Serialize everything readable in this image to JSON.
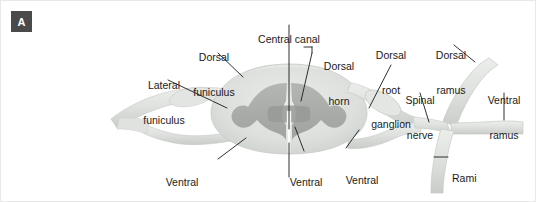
{
  "figure": {
    "panel_label": "A",
    "background_color": "#ffffff"
  },
  "colors": {
    "white_matter": "#d9dcd9",
    "white_matter_light": "#e4e7e4",
    "gray_matter": "#a9aca9",
    "gray_matter_dark": "#9b9e9b",
    "nerve": "#dfe2df",
    "nerve_edge": "#c2c5c2",
    "central_canal": "#fdfdfd",
    "leader_line": "#1a1a1a",
    "text": "#1a1a1a",
    "badge_bg": "#4a4a4a",
    "badge_text": "#ffffff"
  },
  "labels": [
    {
      "id": "central-canal",
      "text": "Central canal",
      "lines": [
        "Central canal"
      ],
      "x": 243,
      "y": 10,
      "w": 90,
      "align": "center"
    },
    {
      "id": "dorsal-funiculus",
      "text": "Dorsal funiculus",
      "lines": [
        "Dorsal",
        "funiculus"
      ],
      "x": 181,
      "y": 28,
      "w": 64,
      "align": "center"
    },
    {
      "id": "lateral-funiculus",
      "text": "Lateral funiculus",
      "lines": [
        "Lateral",
        "funiculus"
      ],
      "x": 131,
      "y": 56,
      "w": 64,
      "align": "center"
    },
    {
      "id": "dorsal-horn",
      "text": "Dorsal horn",
      "lines": [
        "Dorsal",
        "horn"
      ],
      "x": 322,
      "y": 37,
      "w": 44,
      "align": "center"
    },
    {
      "id": "dorsal-root-ganglion",
      "text": "Dorsal root ganglion",
      "lines": [
        "Dorsal",
        "root",
        "ganglion"
      ],
      "x": 362,
      "y": 26,
      "w": 58,
      "align": "center"
    },
    {
      "id": "dorsal-ramus",
      "text": "Dorsal ramus",
      "lines": [
        "Dorsal",
        "ramus"
      ],
      "x": 424,
      "y": 26,
      "w": 52,
      "align": "center"
    },
    {
      "id": "spinal-nerve",
      "text": "Spinal nerve",
      "lines": [
        "Spinal",
        "nerve"
      ],
      "x": 398,
      "y": 71,
      "w": 46,
      "align": "center"
    },
    {
      "id": "ventral-ramus",
      "text": "Ventral ramus",
      "lines": [
        "Ventral",
        "ramus"
      ],
      "x": 478,
      "y": 71,
      "w": 52,
      "align": "center"
    },
    {
      "id": "ventral-funiculus",
      "text": "Ventral funiculus",
      "lines": [
        "Ventral",
        "funiculus"
      ],
      "x": 149,
      "y": 153,
      "w": 64,
      "align": "center"
    },
    {
      "id": "ventral-horn",
      "text": "Ventral horn",
      "lines": [
        "Ventral",
        "horn"
      ],
      "x": 281,
      "y": 153,
      "w": 48,
      "align": "center"
    },
    {
      "id": "ventral-root",
      "text": "Ventral root",
      "lines": [
        "Ventral",
        "root"
      ],
      "x": 337,
      "y": 151,
      "w": 48,
      "align": "center"
    },
    {
      "id": "anterior-median-fissure",
      "text": "Anterior median fissure",
      "lines": [
        "Anterior median fissure"
      ],
      "x": 198,
      "y": 182,
      "w": 140,
      "align": "center"
    },
    {
      "id": "rami-communicantes",
      "text": "Rami communicantes",
      "lines": [
        "Rami",
        "communicantes"
      ],
      "x": 449,
      "y": 150,
      "w": 84,
      "align": "left"
    }
  ],
  "leaders": [
    {
      "id": "leader-central-canal",
      "from": [
        288,
        24
      ],
      "to": [
        288,
        128
      ]
    },
    {
      "id": "leader-dorsal-funiculus",
      "from": [
        217,
        52
      ],
      "to": [
        240,
        75
      ]
    },
    {
      "id": "leader-lateral-funiculus",
      "from": [
        166,
        79
      ],
      "to": [
        224,
        106
      ]
    },
    {
      "id": "leader-dorsal-horn",
      "from": [
        312,
        46
      ],
      "to": [
        303,
        46
      ]
    },
    {
      "id": "leader-dorsal-horn-2",
      "from": [
        312,
        46
      ],
      "to": [
        300,
        100
      ]
    },
    {
      "id": "leader-dorsal-root-ganglion",
      "from": [
        390,
        64
      ],
      "to": [
        366,
        106
      ]
    },
    {
      "id": "leader-dorsal-ramus",
      "from": [
        455,
        46
      ],
      "to": [
        474,
        62
      ]
    },
    {
      "id": "leader-spinal-nerve",
      "from": [
        420,
        92
      ],
      "to": [
        427,
        120
      ]
    },
    {
      "id": "leader-ventral-ramus",
      "from": [
        503,
        92
      ],
      "to": [
        503,
        118
      ]
    },
    {
      "id": "leader-ventral-funiculus",
      "from": [
        216,
        156
      ],
      "to": [
        243,
        136
      ]
    },
    {
      "id": "leader-ventral-horn",
      "from": [
        303,
        150
      ],
      "to": [
        293,
        125
      ]
    },
    {
      "id": "leader-ventral-root",
      "from": [
        345,
        147
      ],
      "to": [
        357,
        128
      ]
    },
    {
      "id": "leader-anterior-median-fissure",
      "from": [
        288,
        176
      ],
      "to": [
        288,
        141
      ]
    },
    {
      "id": "leader-rami-communicantes",
      "from": [
        447,
        155
      ],
      "to": [
        432,
        155
      ]
    }
  ],
  "anatomy_parts": [
    {
      "id": "white-matter",
      "name": "white matter"
    },
    {
      "id": "gray-matter",
      "name": "gray matter (butterfly)"
    },
    {
      "id": "central-canal-slit",
      "name": "central canal"
    },
    {
      "id": "dorsal-root",
      "name": "dorsal root"
    },
    {
      "id": "ventral-root-nerve",
      "name": "ventral root"
    },
    {
      "id": "ganglion-bulge",
      "name": "dorsal root ganglion"
    },
    {
      "id": "spinal-nerve-trunk",
      "name": "spinal nerve trunk"
    },
    {
      "id": "dorsal-ramus-branch",
      "name": "dorsal ramus"
    },
    {
      "id": "ventral-ramus-branch",
      "name": "ventral ramus"
    },
    {
      "id": "rami-comm-branch",
      "name": "rami communicantes"
    },
    {
      "id": "left-nerve",
      "name": "left spinal nerve roots"
    }
  ]
}
